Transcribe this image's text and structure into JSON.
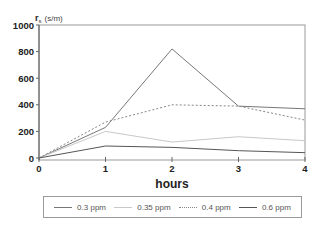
{
  "chart_data": {
    "type": "line",
    "title": "",
    "xlabel": "hours",
    "ylabel": "r",
    "ylabel_subscript": "s",
    "ylabel_units": "(s/m)",
    "x": [
      0,
      1,
      2,
      3,
      4
    ],
    "xticks": [
      "0",
      "1",
      "2",
      "3",
      "4"
    ],
    "yticks": [
      "0",
      "200",
      "400",
      "600",
      "800",
      "1000"
    ],
    "xlim": [
      0,
      4
    ],
    "ylim": [
      0,
      1000
    ],
    "grid": false,
    "legend_position": "bottom",
    "series": [
      {
        "name": "0.3 ppm",
        "values": [
          0,
          230,
          820,
          390,
          370
        ],
        "color": "#777777",
        "dash": ""
      },
      {
        "name": "0.35 ppm",
        "values": [
          0,
          200,
          120,
          160,
          130
        ],
        "color": "#c8c8c8",
        "dash": ""
      },
      {
        "name": "0.4 ppm",
        "values": [
          0,
          270,
          400,
          390,
          285
        ],
        "color": "#888888",
        "dash": "2,2"
      },
      {
        "name": "0.6 ppm",
        "values": [
          0,
          90,
          80,
          55,
          40
        ],
        "color": "#555555",
        "dash": ""
      }
    ]
  },
  "legend": {
    "items": [
      {
        "label": "0.3 ppm"
      },
      {
        "label": "0.35 ppm"
      },
      {
        "label": "0.4 ppm"
      },
      {
        "label": "0.6 ppm"
      }
    ]
  }
}
